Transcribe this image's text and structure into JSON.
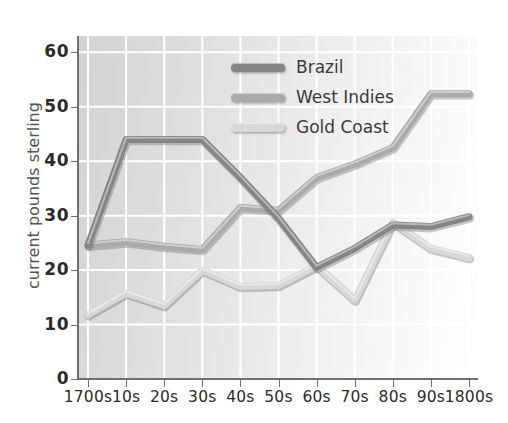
{
  "chart_data": {
    "type": "line",
    "title": "",
    "xlabel": "",
    "ylabel": "current pounds sterling",
    "categories": [
      "1700s",
      "10s",
      "20s",
      "30s",
      "40s",
      "50s",
      "60s",
      "70s",
      "80s",
      "90s",
      "1800s"
    ],
    "x_tick_labels": [
      "1700s",
      "10s",
      "20s",
      "30s",
      "40s",
      "50s",
      "60s",
      "70s",
      "80s",
      "90s",
      "1800s"
    ],
    "y_tick_labels": [
      "0",
      "10",
      "20",
      "30",
      "40",
      "50",
      "60"
    ],
    "y_ticks": [
      0,
      10,
      20,
      30,
      40,
      50,
      60
    ],
    "ylim": [
      0,
      63
    ],
    "grid": true,
    "grid_color": "#ffffff",
    "legend_position": "upper-center",
    "series": [
      {
        "name": "Brazil",
        "color": "#858585",
        "values": [
          24.6,
          44.0,
          44.0,
          44.0,
          37.0,
          29.5,
          20.5,
          24.0,
          28.3,
          28.0,
          29.8
        ]
      },
      {
        "name": "West Indies",
        "color": "#aaaaaa",
        "values": [
          24.6,
          25.2,
          24.4,
          23.8,
          31.5,
          31.0,
          37.0,
          39.5,
          42.5,
          52.4,
          52.4
        ]
      },
      {
        "name": "Gold Coast",
        "color": "#d8d8d8",
        "values": [
          11.8,
          15.8,
          13.5,
          20.0,
          17.0,
          17.2,
          20.8,
          14.5,
          28.8,
          24.0,
          22.3
        ]
      }
    ]
  },
  "legend": {
    "items": [
      {
        "label": "Brazil",
        "color": "#858585"
      },
      {
        "label": "West Indies",
        "color": "#aaaaaa"
      },
      {
        "label": "Gold Coast",
        "color": "#d8d8d8"
      }
    ]
  },
  "axis": {
    "y_title": "current pounds sterling"
  }
}
